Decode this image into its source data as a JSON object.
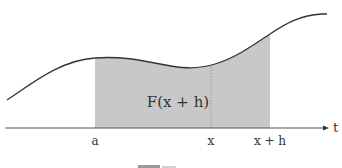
{
  "figure": {
    "region_label": "F(x + h)",
    "axis": {
      "variable": "t",
      "ticks": [
        {
          "id": "a",
          "label": "a",
          "x": 95
        },
        {
          "id": "x",
          "label": "x",
          "x": 211
        },
        {
          "id": "xh",
          "label": "x + h",
          "x": 270
        }
      ]
    },
    "colors": {
      "curve": "#333333",
      "fill": "#c8c8c8",
      "axis": "#555555",
      "dotted": "#9a9a9a"
    },
    "caption_clipped": true
  }
}
